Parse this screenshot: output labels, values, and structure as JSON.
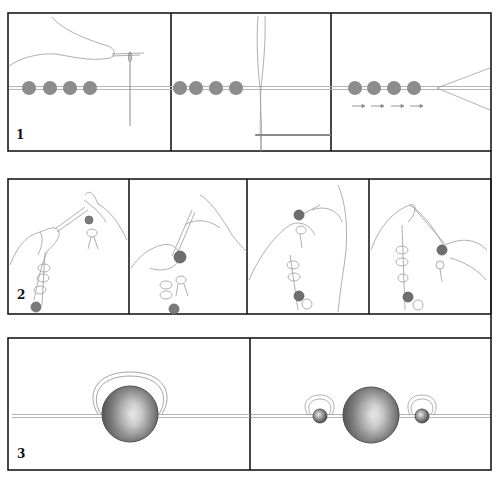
{
  "figure": {
    "steps": [
      {
        "number": "1",
        "description": "Threading beads onto a cord with a needle",
        "panels": [
          {
            "id": "1a",
            "content": "hand holding needle threaded with cord, four grey beads strung on cord"
          },
          {
            "id": "1b",
            "content": "four grey beads on cord, doubled thread loop with needle below"
          },
          {
            "id": "1c",
            "content": "four grey beads pushed along cord, direction arrows, cord ends splaying"
          }
        ],
        "bead_count": 4,
        "arrows": [
          "→",
          "→",
          "→",
          "→"
        ]
      },
      {
        "number": "2",
        "description": "Tying knots between beads by hand",
        "panels": [
          {
            "id": "2a",
            "content": "two hands holding strand of beads, forming a knot"
          },
          {
            "id": "2b",
            "content": "hand wrapping cord around dark bead"
          },
          {
            "id": "2c",
            "content": "knot being pulled next to dark bead"
          },
          {
            "id": "2d",
            "content": "knot tightened, hands pulling cord"
          }
        ]
      },
      {
        "number": "3",
        "description": "Large bead with cord looped around it; large bead flanked by small beads with loops",
        "panels": [
          {
            "id": "3a",
            "content": "large shaded bead on cord with cord loop over top"
          },
          {
            "id": "3b",
            "content": "large shaded bead between two small beads, each small bead with loop"
          }
        ]
      }
    ],
    "colors": {
      "frame": "#1a1a1a",
      "bead_grey": "#8c8c8c",
      "dark_bead": "#6e6e6e",
      "cord": "#b5b5b5",
      "sketch_line": "#9a9a9a"
    }
  }
}
